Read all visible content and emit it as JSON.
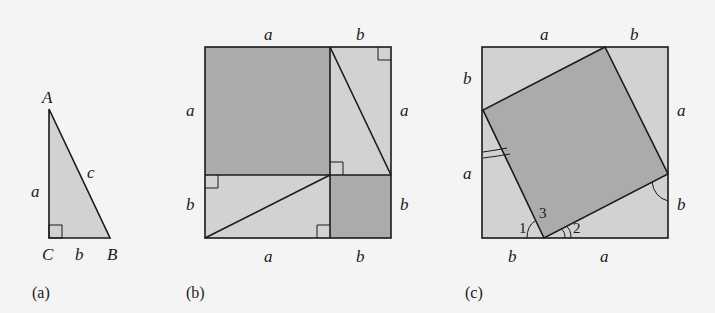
{
  "colors": {
    "background": "#f4f4f4",
    "light_fill": "#d2d2d2",
    "dark_fill": "#ababab",
    "stroke": "#1a1a1a"
  },
  "panel_a": {
    "caption": "(a)",
    "vertices": {
      "A": "A",
      "B": "B",
      "C": "C"
    },
    "sides": {
      "vertical": "a",
      "horizontal": "b",
      "hypotenuse": "c"
    }
  },
  "panel_b": {
    "caption": "(b)",
    "top": [
      "a",
      "b"
    ],
    "bottom": [
      "a",
      "b"
    ],
    "left": [
      "a",
      "b"
    ],
    "right": [
      "a",
      "b"
    ]
  },
  "panel_c": {
    "caption": "(c)",
    "top": [
      "a",
      "b"
    ],
    "bottom": [
      "b",
      "a"
    ],
    "left": [
      "b",
      "a"
    ],
    "right": [
      "a",
      "b"
    ],
    "angles": [
      "1",
      "2",
      "3"
    ]
  }
}
